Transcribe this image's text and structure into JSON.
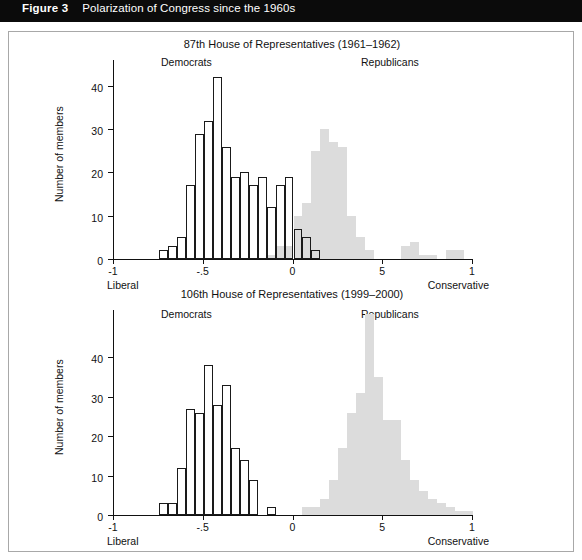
{
  "header": {
    "figure_number": "Figure 3",
    "caption": "Polarization of Congress since the 1960s"
  },
  "chart_data": [
    {
      "type": "bar",
      "title": "87th House of Representatives (1961–1962)",
      "xlabel": "",
      "ylabel": "Number of members",
      "xlim": [
        -1,
        1
      ],
      "ylim": [
        0,
        46
      ],
      "grid": false,
      "legend_position": "inside-top",
      "annotations": [
        "Democrats",
        "Republicans"
      ],
      "axis_end_labels": {
        "left": "Liberal",
        "right": "Conservative"
      },
      "xticks": [
        "-1",
        "-.5",
        "0",
        "5",
        "1"
      ],
      "xtick_values": [
        -1,
        -0.5,
        0,
        0.5,
        1
      ],
      "yticks": [
        "0",
        "10",
        "20",
        "30",
        "40"
      ],
      "ytick_values": [
        0,
        10,
        20,
        30,
        40
      ],
      "bin_width": 0.05,
      "series": [
        {
          "name": "Democrats",
          "color": "#ffffff",
          "x": [
            -0.8,
            -0.75,
            -0.7,
            -0.65,
            -0.6,
            -0.55,
            -0.5,
            -0.45,
            -0.4,
            -0.35,
            -0.3,
            -0.25,
            -0.2,
            -0.15,
            -0.1,
            -0.05,
            0.0,
            0.05,
            0.1,
            0.15,
            0.2,
            0.25,
            0.3
          ],
          "values": [
            0,
            2,
            3,
            5,
            17,
            29,
            32,
            42,
            26,
            19,
            20,
            17,
            19,
            12,
            17,
            19,
            7,
            5,
            2,
            0,
            0,
            0,
            0
          ]
        },
        {
          "name": "Republicans",
          "color": "#dcdcdc",
          "x": [
            -0.15,
            -0.1,
            -0.05,
            0.0,
            0.05,
            0.1,
            0.15,
            0.2,
            0.25,
            0.3,
            0.35,
            0.4,
            0.45,
            0.5,
            0.55,
            0.6,
            0.65,
            0.7,
            0.75,
            0.8,
            0.85,
            0.9,
            0.95
          ],
          "values": [
            1,
            3,
            3,
            10,
            13,
            25,
            30,
            27,
            26,
            10,
            5,
            2,
            0,
            0,
            0,
            3,
            4,
            1,
            1,
            0,
            2,
            2,
            0
          ]
        }
      ]
    },
    {
      "type": "bar",
      "title": "106th House of Representatives (1999–2000)",
      "xlabel": "",
      "ylabel": "Number of members",
      "xlim": [
        -1,
        1
      ],
      "ylim": [
        0,
        52
      ],
      "grid": false,
      "legend_position": "inside-top",
      "annotations": [
        "Democrats",
        "Republicans"
      ],
      "axis_end_labels": {
        "left": "Liberal",
        "right": "Conservative"
      },
      "xticks": [
        "-1",
        "-.5",
        "0",
        "5",
        "1"
      ],
      "xtick_values": [
        -1,
        -0.5,
        0,
        0.5,
        1
      ],
      "yticks": [
        "0",
        "10",
        "20",
        "30",
        "40"
      ],
      "ytick_values": [
        0,
        10,
        20,
        30,
        40
      ],
      "bin_width": 0.05,
      "series": [
        {
          "name": "Democrats",
          "color": "#ffffff",
          "x": [
            -0.8,
            -0.75,
            -0.7,
            -0.65,
            -0.6,
            -0.55,
            -0.5,
            -0.45,
            -0.4,
            -0.35,
            -0.3,
            -0.25,
            -0.2,
            -0.15,
            -0.1,
            -0.05,
            0.0,
            0.05
          ],
          "values": [
            0,
            3,
            3,
            12,
            27,
            26,
            38,
            28,
            33,
            17,
            14,
            9,
            0,
            2,
            0,
            0,
            0,
            0
          ]
        },
        {
          "name": "Republicans",
          "color": "#dcdcdc",
          "x": [
            0.0,
            0.05,
            0.1,
            0.15,
            0.2,
            0.25,
            0.3,
            0.35,
            0.4,
            0.45,
            0.5,
            0.55,
            0.6,
            0.65,
            0.7,
            0.75,
            0.8,
            0.85,
            0.9,
            0.95
          ],
          "values": [
            0,
            2,
            2,
            4,
            9,
            17,
            26,
            31,
            51,
            35,
            24,
            24,
            14,
            9,
            6,
            4,
            3,
            2,
            1,
            1
          ]
        }
      ]
    }
  ]
}
